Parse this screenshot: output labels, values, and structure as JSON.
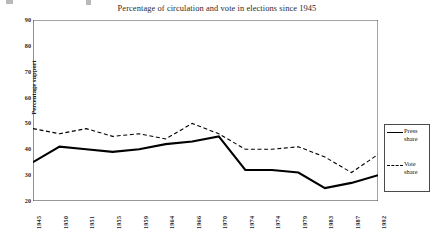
{
  "chart_data": {
    "type": "line",
    "title": "Percentage of circulation and vote in elections since 1945",
    "xlabel": "",
    "ylabel": "Percentage support",
    "ylim": [
      20,
      90
    ],
    "yticks": [
      20,
      30,
      40,
      50,
      60,
      70,
      80,
      90
    ],
    "grid": false,
    "legend_position": "right",
    "categories": [
      "1945",
      "1950",
      "1951",
      "1955",
      "1959",
      "1964",
      "1966",
      "1970",
      "1974",
      "1974",
      "1979",
      "1983",
      "1987",
      "1992"
    ],
    "series": [
      {
        "name": "Press share",
        "style": "solid",
        "color": "#000000",
        "values": [
          35,
          41,
          40,
          39,
          40,
          42,
          43,
          45,
          32,
          32,
          31,
          25,
          27,
          30
        ]
      },
      {
        "name": "Vote share",
        "style": "dashed",
        "color": "#000000",
        "values": [
          48,
          46,
          48,
          45,
          46,
          44,
          50,
          46,
          40,
          40,
          41,
          37,
          31,
          38
        ]
      }
    ]
  },
  "legend": {
    "entries": [
      {
        "label": "Press share",
        "style": "solid"
      },
      {
        "label": "Vote share",
        "style": "dashed"
      }
    ]
  }
}
